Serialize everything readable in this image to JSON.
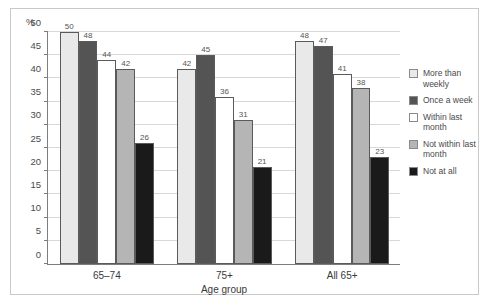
{
  "chart_data": {
    "type": "bar",
    "title": "",
    "xlabel": "Age group",
    "ylabel": "%",
    "ylim": [
      0,
      50
    ],
    "yticks": [
      0,
      5,
      10,
      15,
      20,
      25,
      30,
      35,
      40,
      45,
      50
    ],
    "grid": true,
    "legend_position": "right",
    "categories": [
      "65–74",
      "75+",
      "All 65+"
    ],
    "series": [
      {
        "name": "More than weekly",
        "color": "#e9e9e9",
        "values": [
          50,
          42,
          48
        ]
      },
      {
        "name": "Once a week",
        "color": "#545454",
        "values": [
          48,
          45,
          47
        ]
      },
      {
        "name": "Within last month",
        "color": "#ffffff",
        "values": [
          44,
          36,
          41
        ]
      },
      {
        "name": "Not within last month",
        "color": "#b5b5b5",
        "values": [
          42,
          31,
          38
        ]
      },
      {
        "name": "Not at all",
        "color": "#1a1a1a",
        "values": [
          26,
          21,
          23
        ]
      }
    ]
  },
  "legend": {
    "items": [
      {
        "label": "More than weekly",
        "color": "#e9e9e9"
      },
      {
        "label": "Once a week",
        "color": "#545454"
      },
      {
        "label": "Within last month",
        "color": "#ffffff"
      },
      {
        "label": "Not within last month",
        "color": "#b5b5b5"
      },
      {
        "label": "Not at all",
        "color": "#1a1a1a"
      }
    ]
  }
}
